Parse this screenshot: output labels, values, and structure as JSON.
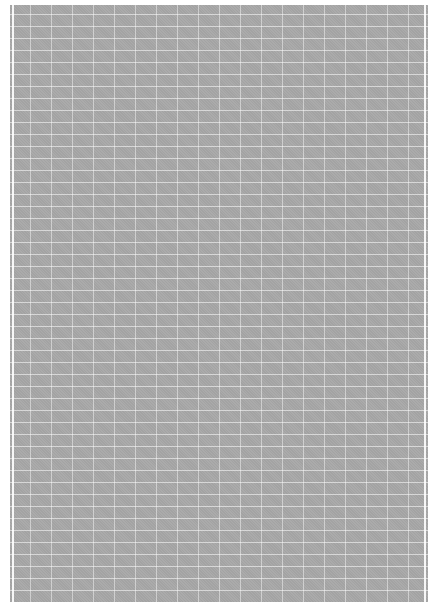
{
  "page": {
    "background": "#ffffff",
    "sheet_color": "#a8a8a8",
    "grid_color": "#ffffff",
    "grid_spacing_x_px": 21,
    "grid_spacing_y_px": 12,
    "text": ""
  }
}
